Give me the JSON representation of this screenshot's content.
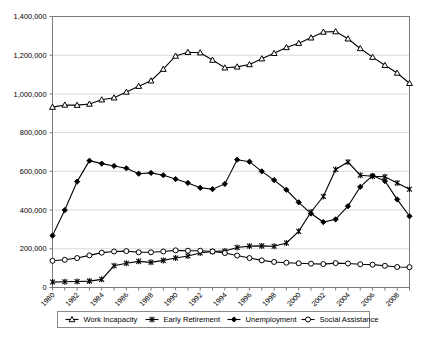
{
  "chart_data": {
    "type": "line",
    "title": "",
    "subtitle": "",
    "xlabel": "",
    "ylabel": "",
    "xlim": [
      1980,
      2009
    ],
    "ylim": [
      0,
      1400000
    ],
    "grid": true,
    "legend_position": "bottom",
    "y_ticks": [
      0,
      200000,
      400000,
      600000,
      800000,
      1000000,
      1200000,
      1400000
    ],
    "y_tick_labels": [
      "0",
      "200,000",
      "400,000",
      "600,000",
      "800,000",
      "1,000,000",
      "1,200,000",
      "1,400,000"
    ],
    "x": [
      1980,
      1981,
      1982,
      1983,
      1984,
      1985,
      1986,
      1987,
      1988,
      1989,
      1990,
      1991,
      1992,
      1993,
      1994,
      1995,
      1996,
      1997,
      1998,
      1999,
      2000,
      2001,
      2002,
      2003,
      2004,
      2005,
      2006,
      2007,
      2008,
      2009
    ],
    "x_tick_labels": [
      "1980",
      "1982",
      "1984",
      "1986",
      "1988",
      "1990",
      "1992",
      "1994",
      "1996",
      "1998",
      "2000",
      "2002",
      "2004",
      "2006",
      "2008"
    ],
    "x_tick_values": [
      1980,
      1982,
      1984,
      1986,
      1988,
      1990,
      1992,
      1994,
      1996,
      1998,
      2000,
      2002,
      2004,
      2006,
      2008
    ],
    "series": [
      {
        "name": "Work Incapacity",
        "marker": "triangle-open",
        "values": [
          932000,
          943000,
          942000,
          948000,
          970000,
          980000,
          1010000,
          1040000,
          1068000,
          1128000,
          1196000,
          1215000,
          1213000,
          1175000,
          1135000,
          1140000,
          1152000,
          1182000,
          1210000,
          1240000,
          1262000,
          1290000,
          1320000,
          1322000,
          1285000,
          1235000,
          1190000,
          1148000,
          1108000,
          1055000
        ]
      },
      {
        "name": "Early Retirement",
        "marker": "cross",
        "values": [
          28000,
          30000,
          31000,
          33000,
          42000,
          112000,
          125000,
          135000,
          130000,
          140000,
          152000,
          163000,
          178000,
          186000,
          189000,
          207000,
          214000,
          215000,
          213000,
          230000,
          290000,
          390000,
          470000,
          610000,
          648000,
          580000,
          575000,
          572000,
          540000,
          508000
        ]
      },
      {
        "name": "Unemployment",
        "marker": "diamond-solid",
        "values": [
          268000,
          400000,
          547000,
          655000,
          640000,
          628000,
          616000,
          588000,
          592000,
          580000,
          560000,
          540000,
          515000,
          508000,
          535000,
          660000,
          650000,
          600000,
          555000,
          505000,
          440000,
          382000,
          338000,
          352000,
          420000,
          520000,
          578000,
          550000,
          455000,
          368000
        ]
      },
      {
        "name": "Social Assistance",
        "marker": "circle-open",
        "values": [
          138000,
          143000,
          152000,
          166000,
          180000,
          186000,
          188000,
          182000,
          182000,
          186000,
          192000,
          190000,
          190000,
          186000,
          178000,
          165000,
          152000,
          140000,
          132000,
          128000,
          125000,
          123000,
          121000,
          126000,
          124000,
          120000,
          118000,
          112000,
          106000,
          105000
        ]
      }
    ]
  },
  "legend": {
    "items": [
      {
        "label": "Work Incapacity",
        "marker": "triangle-open"
      },
      {
        "label": "Early Retirement",
        "marker": "cross"
      },
      {
        "label": "Unemployment",
        "marker": "diamond-solid"
      },
      {
        "label": "Social Assistance",
        "marker": "circle-open"
      }
    ]
  }
}
